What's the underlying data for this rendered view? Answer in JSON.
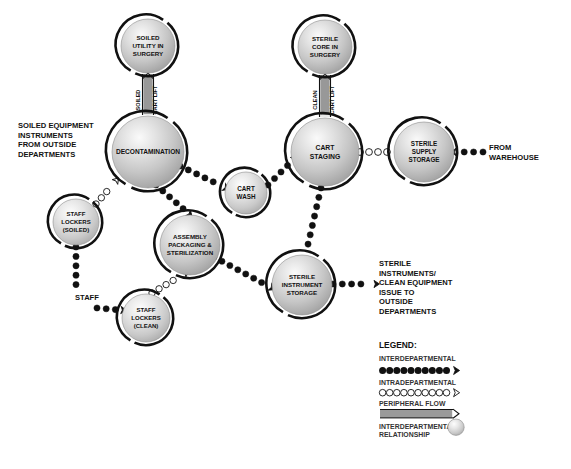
{
  "diagram": {
    "colors": {
      "node_fill_light": "#f2f2f2",
      "node_fill_mid": "#c8c8c8",
      "node_fill_dark": "#9a9a9a",
      "stroke": "#111111",
      "text": "#111111",
      "hollow_fill": "#ffffff"
    },
    "nodes": [
      {
        "id": "soiled-utility-in-surgery",
        "lines": [
          "SOILED",
          "UTILITY IN",
          "SURGERY"
        ],
        "cx": 148,
        "cy": 46,
        "r": 27,
        "font": 6.2
      },
      {
        "id": "sterile-core-in-surgery",
        "lines": [
          "STERILE",
          "CORE IN",
          "SURGERY"
        ],
        "cx": 325,
        "cy": 47,
        "r": 27,
        "font": 6.2
      },
      {
        "id": "decontamination",
        "lines": [
          "DECONTAMINATION"
        ],
        "cx": 148,
        "cy": 152,
        "r": 36,
        "font": 6.6
      },
      {
        "id": "cart-staging",
        "lines": [
          "CART",
          "STAGING"
        ],
        "cx": 325,
        "cy": 152,
        "r": 34,
        "font": 6.8
      },
      {
        "id": "sterile-supply-storage",
        "lines": [
          "STERILE",
          "SUPPLY",
          "STORAGE"
        ],
        "cx": 424,
        "cy": 152,
        "r": 30,
        "font": 6.3
      },
      {
        "id": "cart-wash",
        "lines": [
          "CART",
          "WASH"
        ],
        "cx": 246,
        "cy": 193,
        "r": 21,
        "font": 6.3
      },
      {
        "id": "staff-lockers-soiled",
        "lines": [
          "STAFF",
          "LOCKERS",
          "(SOILED)"
        ],
        "cx": 76,
        "cy": 222,
        "r": 23,
        "font": 6.0
      },
      {
        "id": "assembly-packaging-sterilization",
        "lines": [
          "ASSEMBLY",
          "PACKAGING &",
          "STERILIZATION"
        ],
        "cx": 190,
        "cy": 245,
        "r": 30,
        "font": 6.2
      },
      {
        "id": "sterile-instrument-storage",
        "lines": [
          "STERILE",
          "INSTRUMENT",
          "STORAGE"
        ],
        "cx": 302,
        "cy": 285,
        "r": 30,
        "font": 6.2
      },
      {
        "id": "staff-lockers-clean",
        "lines": [
          "STAFF",
          "LOCKERS",
          "(CLEAN)"
        ],
        "cx": 146,
        "cy": 318,
        "r": 24,
        "font": 6.0
      }
    ],
    "external_labels": [
      {
        "id": "soiled-equipment-source",
        "lines": [
          "SOILED EQUIPMENT",
          "INSTRUMENTS",
          "FROM OUTSIDE",
          "DEPARTMENTS"
        ],
        "x": 18,
        "y": 128,
        "font": 7.6,
        "line_height": 9.6,
        "anchor": "start"
      },
      {
        "id": "from-warehouse",
        "lines": [
          "FROM",
          "WAREHOUSE"
        ],
        "x": 489,
        "y": 150,
        "font": 7.6,
        "line_height": 9.6,
        "anchor": "start"
      },
      {
        "id": "sterile-issue-destination",
        "lines": [
          "STERILE",
          "INSTRUMENTS/",
          "CLEAN EQUIPMENT",
          "ISSUE TO",
          "OUTSIDE",
          "DEPARTMENTS"
        ],
        "x": 379,
        "y": 266,
        "font": 7.6,
        "line_height": 9.6,
        "anchor": "start"
      },
      {
        "id": "staff-entry",
        "lines": [
          "STAFF"
        ],
        "x": 75,
        "y": 300,
        "font": 7.6,
        "line_height": 9.6,
        "anchor": "start"
      }
    ],
    "lift_labels": [
      {
        "id": "soiled-cart-lift",
        "left_text": "SOILED",
        "right_text": "CART LIFT",
        "x": 148,
        "y": 100,
        "font": 5.6
      },
      {
        "id": "clean-cart-lift",
        "left_text": "CLEAN",
        "right_text": "CART LIFT",
        "x": 325,
        "y": 100,
        "font": 5.6
      }
    ],
    "connections": [
      {
        "id": "soiled-utility-to-decontamination",
        "type": "peripheral",
        "from": "soiled-utility-in-surgery",
        "to": "decontamination"
      },
      {
        "id": "sterile-core-to-cart-staging",
        "type": "peripheral",
        "from": "sterile-core-in-surgery",
        "to": "cart-staging"
      },
      {
        "id": "outside-to-decontamination",
        "type": "interdepartmental",
        "from": "outside-departments",
        "to": "decontamination"
      },
      {
        "id": "decontamination-to-cart-wash",
        "type": "interdepartmental",
        "from": "decontamination",
        "to": "cart-wash"
      },
      {
        "id": "cart-wash-to-cart-staging",
        "type": "interdepartmental",
        "from": "cart-wash",
        "to": "cart-staging"
      },
      {
        "id": "decontamination-to-assembly",
        "type": "interdepartmental",
        "from": "decontamination",
        "to": "assembly-packaging-sterilization"
      },
      {
        "id": "assembly-to-sterile-instrument-storage",
        "type": "interdepartmental",
        "from": "assembly-packaging-sterilization",
        "to": "sterile-instrument-storage"
      },
      {
        "id": "cart-staging-to-sterile-instrument-storage",
        "type": "interdepartmental",
        "from": "cart-staging",
        "to": "sterile-instrument-storage"
      },
      {
        "id": "warehouse-to-sterile-supply-storage",
        "type": "interdepartmental",
        "from": "warehouse",
        "to": "sterile-supply-storage"
      },
      {
        "id": "sterile-instrument-storage-to-outside",
        "type": "interdepartmental",
        "from": "sterile-instrument-storage",
        "to": "outside-departments"
      },
      {
        "id": "staff-to-staff-lockers-clean",
        "type": "interdepartmental",
        "from": "staff",
        "to": "staff-lockers-clean"
      },
      {
        "id": "staff-lockers-soiled-to-staff-lockers-clean",
        "type": "interdepartmental",
        "from": "staff-lockers-soiled",
        "to": "staff-lockers-clean"
      },
      {
        "id": "staff-lockers-soiled-to-decontamination",
        "type": "intradepartmental",
        "from": "staff-lockers-soiled",
        "to": "decontamination"
      },
      {
        "id": "staff-lockers-clean-to-assembly",
        "type": "intradepartmental",
        "from": "staff-lockers-clean",
        "to": "assembly-packaging-sterilization"
      },
      {
        "id": "cart-staging-to-sterile-supply-storage",
        "type": "intradepartmental",
        "from": "cart-staging",
        "to": "sterile-supply-storage"
      }
    ]
  },
  "legend": {
    "title": "LEGEND:",
    "x": 379,
    "y": 348,
    "items": [
      {
        "id": "interdepartmental",
        "label": "INTERDEPARTMENTAL",
        "symbol": "filled-dots-arrow"
      },
      {
        "id": "intradepartmental",
        "label": "INTRADEPARTMENTAL",
        "symbol": "hollow-dots-arrow"
      },
      {
        "id": "peripheral-flow",
        "label": "PERIPHERAL FLOW",
        "symbol": "hatched-band-arrow"
      },
      {
        "id": "interdepartmental-relationship",
        "label": "INTERDEPARTMENTAL\nRELATIONSHIP",
        "symbol": "sphere"
      }
    ]
  }
}
